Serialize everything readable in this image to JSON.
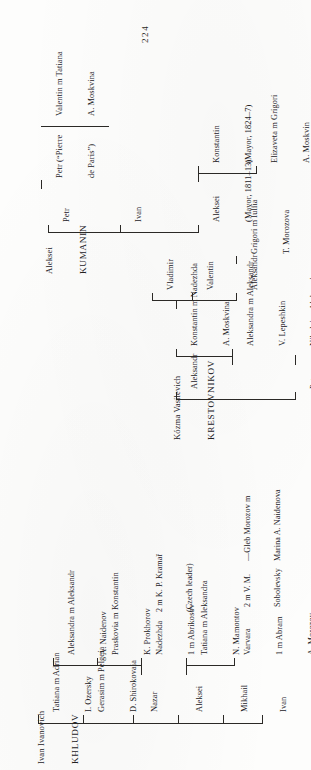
{
  "document": {
    "type": "genealogical-chart",
    "page_number": "224",
    "families": [
      "Khludov",
      "Kumanin",
      "Krestovnikov"
    ]
  },
  "khludov": {
    "patriarch_given": "Ivan Ivanovich",
    "patriarch_surname": "KHLUDOV",
    "children": [
      {
        "name": "Ivan"
      },
      {
        "name": "Mikhail"
      },
      {
        "name": "Aleksei"
      },
      {
        "name": "Nazar"
      },
      {
        "name": "Gerasim m Pelgeia",
        "line2": "D. Shirokovaia"
      },
      {
        "name": "Tatiana m Adrian",
        "line2": "I. Ozersky"
      }
    ],
    "aleksei_children": [
      {
        "name": "Varvara",
        "line2": "1 m Abram",
        "line3": "A. Morozov"
      },
      {
        "name": "Tatiana m Aleksandra",
        "line2": "N. Mamontov"
      }
    ],
    "varvara_second": {
      "line1": "2 m V. M.",
      "line2": "Sobolevsky"
    },
    "varvara_issue": {
      "line1": "—Gleb Morozov m",
      "line2": "Marina A. Naidenova"
    },
    "nazar_children": [
      {
        "name": "Nadezhda",
        "line2": "1 m Abrikosov"
      },
      {
        "name": "Praskovia m Konstantin",
        "line2": "K. Prokhorov"
      },
      {
        "name": "Aleksandra m Aleksandr",
        "line2": "A. Naidenov"
      }
    ],
    "nadezhda_second": {
      "line1": "2 m K. P. Kramař",
      "line2": "(Czech leader)"
    }
  },
  "kumanin": {
    "patriarch_given": "Aleksei",
    "patriarch_surname": "KUMANIN",
    "children": [
      {
        "name": "Aleksei",
        "line2": "(Mayor, 1811–13)"
      },
      {
        "name": "Ivan"
      },
      {
        "name": "Petr"
      }
    ],
    "konstantin": {
      "name": "Konstantin",
      "line2": "(Mayor, 1824–7)"
    },
    "elizaveta": {
      "name": "Elizaveta m Grigori",
      "line2": "A. Moskvin"
    },
    "petr_child": {
      "name": "Petr (“Pierre",
      "line2": "de Paris”)"
    },
    "valentin": {
      "name": "Valentin m Tatiana",
      "line2": "A. Moskvina"
    }
  },
  "krestovnikov": {
    "patriarch_given": "Kózma Vasilevich",
    "patriarch_surname": "KRESTOVNIKOV",
    "children": [
      {
        "name": "Petr"
      },
      {
        "name": "Aleksandr"
      }
    ],
    "aleksandr_children": [
      {
        "name": "Aleksandra m Aleksandr",
        "line2": "V. Lepeshkin"
      },
      {
        "name": "Konstantin m Nadezhda",
        "line2": "A. Moskvina"
      }
    ],
    "petr_child": {
      "name": "Nikolai m Aleksandra",
      "line2": "I. Chetverikova"
    },
    "konstantin_children": [
      {
        "name": "Aleksandr"
      },
      {
        "name": "Valentin"
      },
      {
        "name": "Vladimir"
      }
    ],
    "grigori": {
      "name": "Grigori m Iuliia",
      "line2": "T. Morozova"
    }
  }
}
